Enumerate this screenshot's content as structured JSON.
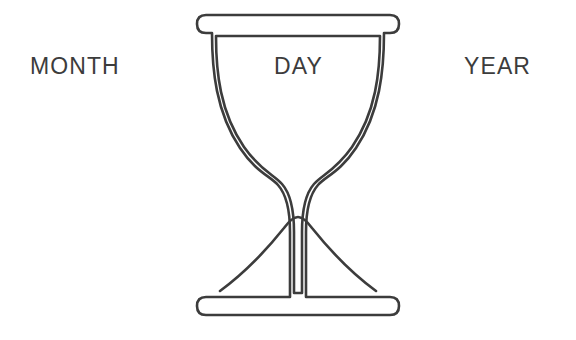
{
  "page": {
    "background_color": "#ffffff",
    "stroke_color": "#3c3c3c",
    "width": 576,
    "height": 340
  },
  "labels": {
    "month": "MONTH",
    "day": "DAY",
    "year": "YEAR"
  },
  "illustration": {
    "name": "hourglass",
    "description": "Line-art hourglass with top and bottom caps, double outline, and a sand mound in the lower bulb",
    "stroke_color": "#3c3c3c",
    "fill_color": "#ffffff"
  }
}
